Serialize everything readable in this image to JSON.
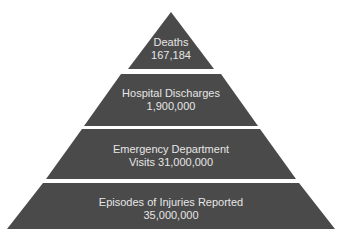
{
  "diagram": {
    "type": "pyramid",
    "fill_color": "#4a4a4a",
    "text_color": "#e6e6e6",
    "tiers": [
      {
        "line1": "Deaths",
        "line2": "167,184"
      },
      {
        "line1": "Hospital Discharges",
        "line2": "1,900,000"
      },
      {
        "line1": "Emergency Department",
        "line2": "Visits 31,000,000"
      },
      {
        "line1": "Episodes of Injuries Reported",
        "line2": "35,000,000"
      }
    ]
  }
}
